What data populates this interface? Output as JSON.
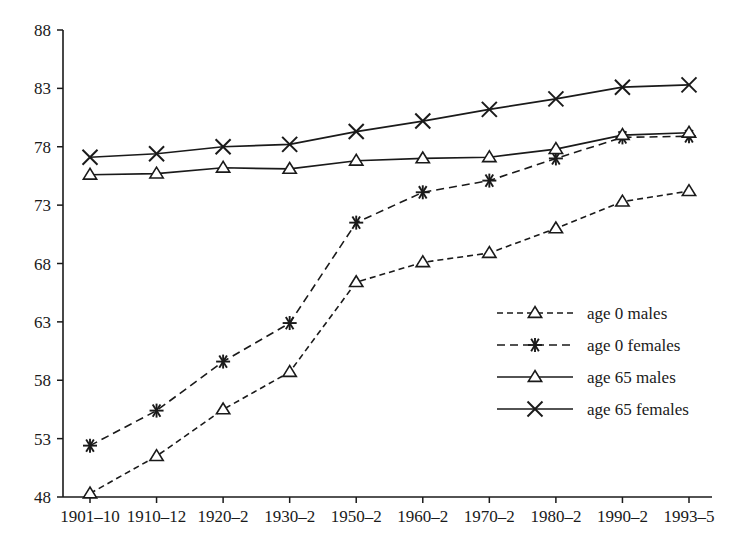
{
  "chart_data": {
    "type": "line",
    "title": "",
    "xlabel": "",
    "ylabel": "",
    "categories": [
      "1901–10",
      "1910–12",
      "1920–2",
      "1930–2",
      "1950–2",
      "1960–2",
      "1970–2",
      "1980–2",
      "1990–2",
      "1993–5"
    ],
    "ylim": [
      48,
      88
    ],
    "yticks": [
      48,
      53,
      58,
      63,
      68,
      73,
      78,
      83,
      88
    ],
    "grid": false,
    "legend_position": "center-right",
    "series": [
      {
        "name": "age 0 males",
        "marker": "triangle",
        "linestyle": "dashed",
        "values": [
          48.3,
          51.5,
          55.5,
          58.7,
          66.4,
          68.1,
          68.9,
          71.0,
          73.3,
          74.2
        ]
      },
      {
        "name": "age 0 females",
        "marker": "star",
        "linestyle": "dashed",
        "values": [
          52.4,
          55.4,
          59.6,
          62.9,
          71.5,
          74.1,
          75.1,
          77.0,
          78.8,
          78.9
        ]
      },
      {
        "name": "age 65 males",
        "marker": "triangle",
        "linestyle": "solid",
        "values": [
          75.6,
          75.7,
          76.2,
          76.1,
          76.8,
          77.0,
          77.1,
          77.8,
          79.0,
          79.2
        ]
      },
      {
        "name": "age 65 females",
        "marker": "cross",
        "linestyle": "solid",
        "values": [
          77.1,
          77.4,
          78.0,
          78.2,
          79.3,
          80.2,
          81.2,
          82.1,
          83.1,
          83.3
        ]
      }
    ]
  },
  "legend": {
    "items": [
      {
        "label": "age 0 males"
      },
      {
        "label": "age 0 females"
      },
      {
        "label": "age 65 males"
      },
      {
        "label": "age 65 females"
      }
    ]
  },
  "axis": {
    "y_tick_labels": [
      "88",
      "83",
      "78",
      "73",
      "68",
      "63",
      "58",
      "53",
      "48"
    ],
    "x_tick_labels": [
      "1901–10",
      "1910–12",
      "1920–2",
      "1930–2",
      "1950–2",
      "1960–2",
      "1970–2",
      "1980–2",
      "1990–2",
      "1993–5"
    ]
  },
  "colors": {
    "ink": "#1a1a1a",
    "background": "#ffffff"
  }
}
